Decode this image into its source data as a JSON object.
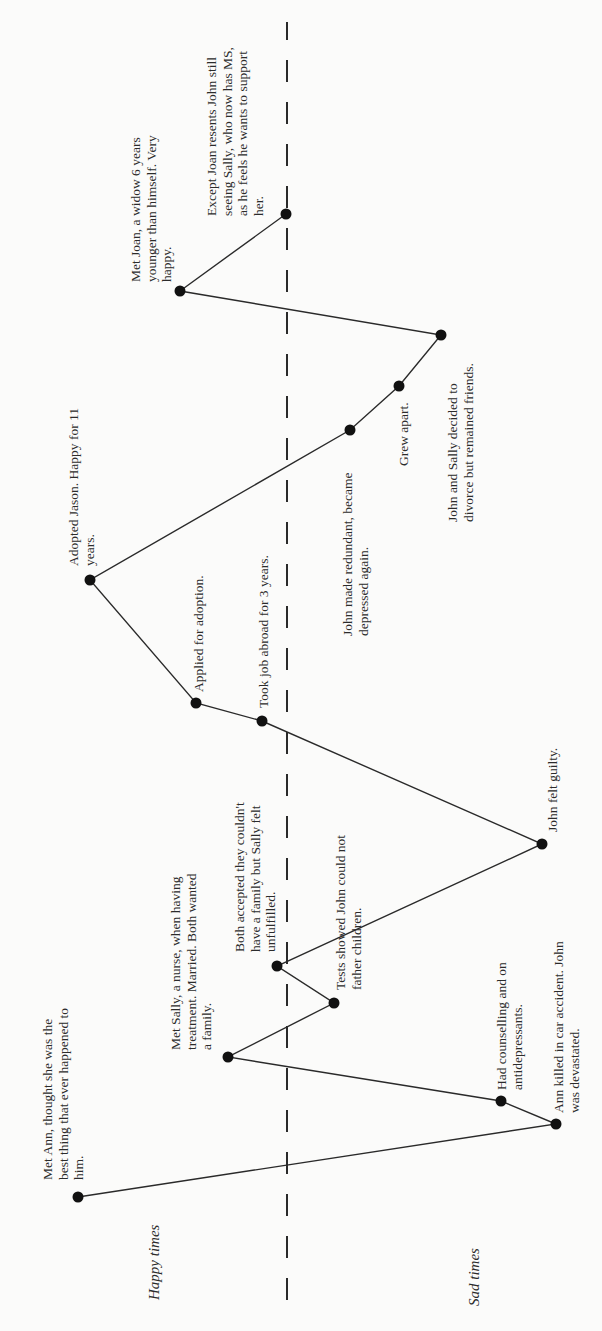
{
  "chart_data": {
    "type": "line",
    "title": "",
    "orientation": "rotated -90deg (time runs bottom to top, happiness increases to the left)",
    "axis_labels": {
      "happy": "Happy times",
      "sad": "Sad times"
    },
    "baseline": {
      "style": "dashed",
      "meaning": "neutral line between happy and sad times"
    },
    "points": [
      {
        "order": 1,
        "label": "Met Ann, thought she was the best thing that ever happened to him.",
        "mood": "happy"
      },
      {
        "order": 2,
        "label": "Ann killed in car accident. John was devastated.",
        "mood": "sad"
      },
      {
        "order": 3,
        "label": "Had counselling and on antidepressants.",
        "mood": "sad"
      },
      {
        "order": 4,
        "label": "Met Sally, a nurse, when having treatment. Married. Both wanted a family.",
        "mood": "happy"
      },
      {
        "order": 5,
        "label": "Tests showed John could not father children.",
        "mood": "slightly sad"
      },
      {
        "order": 6,
        "label": "Both accepted they couldn't have a family but Sally felt unfulfilled.",
        "mood": "neutral"
      },
      {
        "order": 7,
        "label": "John felt guilty.",
        "mood": "sad"
      },
      {
        "order": 8,
        "label": "Took job abroad for 3 years.",
        "mood": "slightly happy"
      },
      {
        "order": 9,
        "label": "Applied for adoption.",
        "mood": "happy"
      },
      {
        "order": 10,
        "label": "Adopted Jason. Happy for 11 years.",
        "mood": "very happy"
      },
      {
        "order": 11,
        "label": "John made redundant, became depressed again.",
        "mood": "sad"
      },
      {
        "order": 12,
        "label": "Grew apart.",
        "mood": "sad"
      },
      {
        "order": 13,
        "label": "John and Sally decided to divorce but remained friends.",
        "mood": "sad"
      },
      {
        "order": 14,
        "label": "Met Joan, a widow 6 years younger than himself. Very happy.",
        "mood": "happy"
      },
      {
        "order": 15,
        "label": "Except Joan resents John still seeing Sally, who now has MS, as he feels he wants to support her.",
        "mood": "neutral"
      }
    ]
  },
  "diagram": {
    "axis": {
      "happy_label": "Happy times",
      "sad_label": "Sad times"
    },
    "colors": {
      "background": "#fbfbfa",
      "line": "#2a2a2a",
      "point": "#111111",
      "text": "#2b2b2b"
    },
    "baseline_x": 287,
    "nodes": [
      {
        "id": "met-ann",
        "x": 78,
        "y": 1197
      },
      {
        "id": "ann-killed",
        "x": 556,
        "y": 1124
      },
      {
        "id": "had-counselling",
        "x": 501,
        "y": 1101
      },
      {
        "id": "met-sally",
        "x": 228,
        "y": 1057
      },
      {
        "id": "tests-showed",
        "x": 334,
        "y": 1003
      },
      {
        "id": "both-accepted",
        "x": 277,
        "y": 966
      },
      {
        "id": "john-felt-guilty",
        "x": 542,
        "y": 844
      },
      {
        "id": "took-job-abroad",
        "x": 262,
        "y": 721
      },
      {
        "id": "applied-adoption",
        "x": 196,
        "y": 703
      },
      {
        "id": "adopted-jason",
        "x": 90,
        "y": 580
      },
      {
        "id": "made-redundant",
        "x": 350,
        "y": 430
      },
      {
        "id": "grew-apart",
        "x": 399,
        "y": 386
      },
      {
        "id": "decided-divorce",
        "x": 441,
        "y": 335
      },
      {
        "id": "met-joan",
        "x": 180,
        "y": 291
      },
      {
        "id": "joan-resents",
        "x": 286,
        "y": 214
      }
    ],
    "labels": {
      "met_ann": [
        "Met Ann, thought she was the",
        "best thing that ever happened to",
        "him."
      ],
      "met_sally": [
        "Met Sally, a nurse, when having",
        "treatment. Married. Both wanted",
        "a family."
      ],
      "both_accepted": [
        "Both accepted they couldn't",
        "have a family but Sally felt",
        "unfulfilled."
      ],
      "tests_showed": [
        "Tests showed John could not",
        "father children."
      ],
      "had_counselling": [
        "Had counselling and on",
        "antidepressants."
      ],
      "ann_killed": [
        "Ann killed in car accident. John",
        "was devastated."
      ],
      "john_guilty": [
        "John felt guilty."
      ],
      "applied": [
        "Applied for adoption."
      ],
      "took_job": [
        "Took job abroad for 3 years."
      ],
      "adopted": [
        "Adopted Jason. Happy for 11",
        "years."
      ],
      "redundant": [
        "John made redundant, became",
        "depressed again."
      ],
      "grew_apart": [
        "Grew apart."
      ],
      "divorce": [
        "John and Sally decided to",
        "divorce but remained friends."
      ],
      "met_joan": [
        "Met Joan, a widow 6 years",
        "younger than himself. Very",
        "happy."
      ],
      "joan_resents": [
        "Except Joan resents John still",
        "seeing Sally, who now has MS,",
        "as he feels he wants to support",
        "her."
      ]
    }
  }
}
